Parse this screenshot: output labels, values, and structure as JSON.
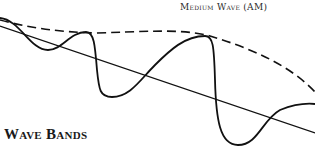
{
  "diagram": {
    "title": "Wave Bands",
    "envelope_label": "Medium Wave (AM)",
    "colors": {
      "ink": "#111111",
      "background": "#ffffff"
    },
    "elements": [
      "carrier-wave",
      "dashed-envelope",
      "baseline-axis"
    ]
  }
}
